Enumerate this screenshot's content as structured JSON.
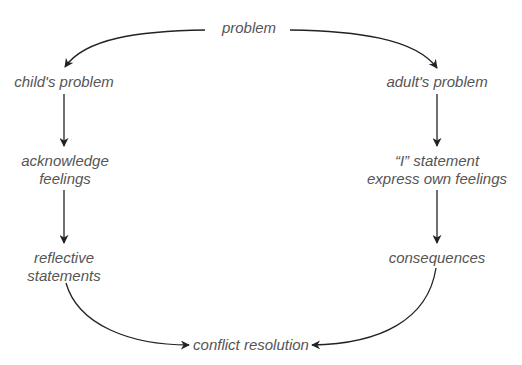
{
  "diagram": {
    "type": "flowchart",
    "colors": {
      "text": "#555555",
      "arrow": "#222222",
      "background": "#ffffff"
    },
    "nodes": {
      "root": {
        "lines": [
          "problem"
        ]
      },
      "left_branch": {
        "lines": [
          "child's problem"
        ]
      },
      "left_step1": {
        "lines": [
          "acknowledge",
          "feelings"
        ]
      },
      "left_step2": {
        "lines": [
          "reflective",
          "statements"
        ]
      },
      "right_branch": {
        "lines": [
          "adult's problem"
        ]
      },
      "right_step1": {
        "lines": [
          "“I” statement",
          "express own feelings"
        ]
      },
      "right_step2": {
        "lines": [
          "consequences"
        ]
      },
      "end": {
        "lines": [
          "conflict resolution"
        ]
      }
    },
    "edges": [
      {
        "from": "root",
        "to": "left_branch"
      },
      {
        "from": "root",
        "to": "right_branch"
      },
      {
        "from": "left_branch",
        "to": "left_step1"
      },
      {
        "from": "left_step1",
        "to": "left_step2"
      },
      {
        "from": "left_step2",
        "to": "end"
      },
      {
        "from": "right_branch",
        "to": "right_step1"
      },
      {
        "from": "right_step1",
        "to": "right_step2"
      },
      {
        "from": "right_step2",
        "to": "end"
      }
    ]
  }
}
